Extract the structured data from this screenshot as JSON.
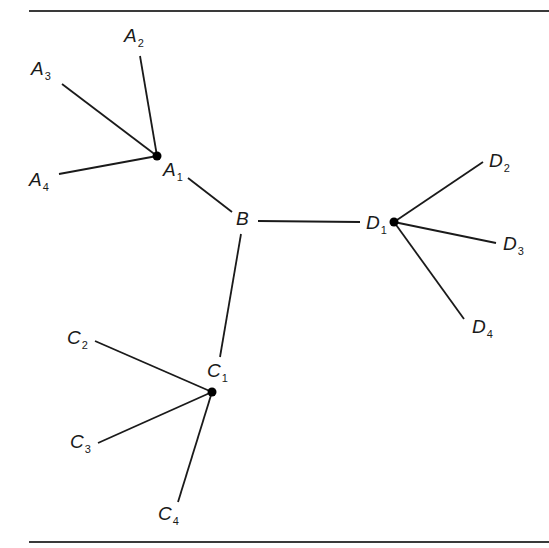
{
  "diagram": {
    "type": "tree",
    "stroke_color": "#1a1a1a",
    "rules": {
      "top": {
        "x1": 29,
        "x2": 549,
        "y": 11
      },
      "bottom": {
        "x1": 29,
        "x2": 549,
        "y": 542
      }
    },
    "nodes": [
      {
        "id": "A1",
        "letter": "A",
        "sub": "1",
        "dot": true,
        "x": 157,
        "y": 156,
        "label_x": 163,
        "label_y": 160
      },
      {
        "id": "A2",
        "letter": "A",
        "sub": "2",
        "dot": false,
        "x": 140,
        "y": 56,
        "label_x": 124,
        "label_y": 26
      },
      {
        "id": "A3",
        "letter": "A",
        "sub": "3",
        "dot": false,
        "x": 62,
        "y": 84,
        "label_x": 31,
        "label_y": 59
      },
      {
        "id": "A4",
        "letter": "A",
        "sub": "4",
        "dot": false,
        "x": 59,
        "y": 174,
        "label_x": 29,
        "label_y": 170
      },
      {
        "id": "B",
        "letter": "B",
        "sub": "",
        "dot": false,
        "x": 244,
        "y": 218,
        "label_x": 236,
        "label_y": 209
      },
      {
        "id": "D1",
        "letter": "D",
        "sub": "1",
        "dot": true,
        "x": 394,
        "y": 222,
        "label_x": 366,
        "label_y": 213
      },
      {
        "id": "D2",
        "letter": "D",
        "sub": "2",
        "dot": false,
        "x": 483,
        "y": 162,
        "label_x": 489,
        "label_y": 151
      },
      {
        "id": "D3",
        "letter": "D",
        "sub": "3",
        "dot": false,
        "x": 496,
        "y": 243,
        "label_x": 503,
        "label_y": 234
      },
      {
        "id": "D4",
        "letter": "D",
        "sub": "4",
        "dot": false,
        "x": 464,
        "y": 319,
        "label_x": 472,
        "label_y": 317
      },
      {
        "id": "C1",
        "letter": "C",
        "sub": "1",
        "dot": true,
        "x": 212,
        "y": 392,
        "label_x": 207,
        "label_y": 361
      },
      {
        "id": "C2",
        "letter": "C",
        "sub": "2",
        "dot": false,
        "x": 95,
        "y": 341,
        "label_x": 67,
        "label_y": 328
      },
      {
        "id": "C3",
        "letter": "C",
        "sub": "3",
        "dot": false,
        "x": 98,
        "y": 443,
        "label_x": 70,
        "label_y": 432
      },
      {
        "id": "C4",
        "letter": "C",
        "sub": "4",
        "dot": false,
        "x": 178,
        "y": 502,
        "label_x": 158,
        "label_y": 504
      }
    ],
    "edges": [
      {
        "from": "A1",
        "to": "A2",
        "x1": 157,
        "y1": 156,
        "x2": 140,
        "y2": 56
      },
      {
        "from": "A1",
        "to": "A3",
        "x1": 157,
        "y1": 156,
        "x2": 62,
        "y2": 84
      },
      {
        "from": "A1",
        "to": "A4",
        "x1": 157,
        "y1": 156,
        "x2": 59,
        "y2": 174
      },
      {
        "from": "A1",
        "to": "B",
        "x1": 188,
        "y1": 178,
        "x2": 232,
        "y2": 212
      },
      {
        "from": "B",
        "to": "D1",
        "x1": 258,
        "y1": 221,
        "x2": 360,
        "y2": 222
      },
      {
        "from": "B",
        "to": "C1",
        "x1": 241,
        "y1": 234,
        "x2": 220,
        "y2": 357
      },
      {
        "from": "D1",
        "to": "D2",
        "x1": 394,
        "y1": 222,
        "x2": 483,
        "y2": 162
      },
      {
        "from": "D1",
        "to": "D3",
        "x1": 394,
        "y1": 222,
        "x2": 496,
        "y2": 243
      },
      {
        "from": "D1",
        "to": "D4",
        "x1": 394,
        "y1": 222,
        "x2": 464,
        "y2": 319
      },
      {
        "from": "C1",
        "to": "C2",
        "x1": 212,
        "y1": 392,
        "x2": 95,
        "y2": 341
      },
      {
        "from": "C1",
        "to": "C3",
        "x1": 212,
        "y1": 392,
        "x2": 98,
        "y2": 443
      },
      {
        "from": "C1",
        "to": "C4",
        "x1": 212,
        "y1": 392,
        "x2": 178,
        "y2": 502
      }
    ]
  }
}
